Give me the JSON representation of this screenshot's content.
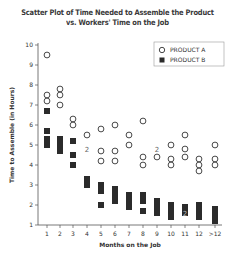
{
  "chart_data": {
    "type": "scatter",
    "title": "Scatter Plot of Time Needed to Assemble the Product",
    "subtitle": "vs. Workers' Time on the Job",
    "xlabel": "Months on the Job",
    "ylabel": "Time to Assemble (in Hours)",
    "categories": [
      "1",
      "2",
      "3",
      "4",
      "5",
      "6",
      "7",
      "8",
      "9",
      "10",
      "11",
      "12",
      ">12"
    ],
    "yticks": [
      1,
      2,
      3,
      4,
      5,
      6,
      7,
      8,
      9,
      10
    ],
    "ylim": [
      1,
      10
    ],
    "grid": false,
    "legend_position": "top-right",
    "series": [
      {
        "name": "PRODUCT A",
        "marker": "open-circle",
        "points": [
          {
            "x": "1",
            "y": 9.5
          },
          {
            "x": "1",
            "y": 7.5
          },
          {
            "x": "1",
            "y": 7.2
          },
          {
            "x": "2",
            "y": 7.8
          },
          {
            "x": "2",
            "y": 7.5
          },
          {
            "x": "2",
            "y": 7.0
          },
          {
            "x": "3",
            "y": 6.3
          },
          {
            "x": "3",
            "y": 6.0
          },
          {
            "x": "4",
            "y": 5.5
          },
          {
            "x": "4",
            "y": 4.8,
            "count": 2
          },
          {
            "x": "5",
            "y": 5.8
          },
          {
            "x": "5",
            "y": 4.7
          },
          {
            "x": "5",
            "y": 4.2
          },
          {
            "x": "6",
            "y": 6.0
          },
          {
            "x": "6",
            "y": 4.7
          },
          {
            "x": "6",
            "y": 4.2
          },
          {
            "x": "7",
            "y": 5.5
          },
          {
            "x": "7",
            "y": 5.0
          },
          {
            "x": "8",
            "y": 6.2
          },
          {
            "x": "8",
            "y": 4.4
          },
          {
            "x": "8",
            "y": 4.0
          },
          {
            "x": "9",
            "y": 4.8,
            "count": 2
          },
          {
            "x": "9",
            "y": 4.4
          },
          {
            "x": "10",
            "y": 5.0
          },
          {
            "x": "10",
            "y": 4.3
          },
          {
            "x": "10",
            "y": 4.0
          },
          {
            "x": "11",
            "y": 5.5
          },
          {
            "x": "11",
            "y": 4.8
          },
          {
            "x": "11",
            "y": 4.4
          },
          {
            "x": "12",
            "y": 4.3
          },
          {
            "x": "12",
            "y": 4.0
          },
          {
            "x": "12",
            "y": 3.7
          },
          {
            "x": ">12",
            "y": 5.0
          },
          {
            "x": ">12",
            "y": 4.3
          },
          {
            "x": ">12",
            "y": 4.0
          }
        ]
      },
      {
        "name": "PRODUCT B",
        "marker": "filled-square",
        "points": [
          {
            "x": "1",
            "y": 6.7
          },
          {
            "x": "1",
            "y": 5.7
          },
          {
            "x": "1",
            "y": 5.3
          },
          {
            "x": "1",
            "y": 5.0
          },
          {
            "x": "2",
            "y": 5.3
          },
          {
            "x": "2",
            "y": 5.0
          },
          {
            "x": "2",
            "y": 4.7
          },
          {
            "x": "3",
            "y": 5.2
          },
          {
            "x": "3",
            "y": 4.5
          },
          {
            "x": "3",
            "y": 4.0
          },
          {
            "x": "4",
            "y": 3.3
          },
          {
            "x": "4",
            "y": 3.0
          },
          {
            "x": "5",
            "y": 3.0
          },
          {
            "x": "5",
            "y": 2.7
          },
          {
            "x": "5",
            "y": 2.0
          },
          {
            "x": "6",
            "y": 2.8
          },
          {
            "x": "6",
            "y": 2.5
          },
          {
            "x": "6",
            "y": 2.2
          },
          {
            "x": "7",
            "y": 2.5
          },
          {
            "x": "7",
            "y": 2.2
          },
          {
            "x": "7",
            "y": 1.9
          },
          {
            "x": "8",
            "y": 2.5
          },
          {
            "x": "8",
            "y": 2.2
          },
          {
            "x": "8",
            "y": 1.7
          },
          {
            "x": "9",
            "y": 2.2
          },
          {
            "x": "9",
            "y": 1.9
          },
          {
            "x": "9",
            "y": 1.6
          },
          {
            "x": "10",
            "y": 2.0
          },
          {
            "x": "10",
            "y": 1.7
          },
          {
            "x": "10",
            "y": 1.4
          },
          {
            "x": "11",
            "y": 1.9
          },
          {
            "x": "11",
            "y": 1.6,
            "count": 2
          },
          {
            "x": "12",
            "y": 2.0
          },
          {
            "x": "12",
            "y": 1.7
          },
          {
            "x": "12",
            "y": 1.4
          },
          {
            "x": ">12",
            "y": 1.8
          },
          {
            "x": ">12",
            "y": 1.5
          },
          {
            "x": ">12",
            "y": 1.2
          }
        ]
      }
    ],
    "annotations": [
      "\"2\" labels indicate two overlapping data points"
    ]
  },
  "legend": {
    "items": [
      {
        "label": "PRODUCT A",
        "marker": "open-circle"
      },
      {
        "label": "PRODUCT B",
        "marker": "filled-square"
      }
    ]
  },
  "colors": {
    "ink": "#333333",
    "marker_fill": "#2b2b2b",
    "axis": "#555555"
  },
  "layout": {
    "x_pixel": [
      47,
      60,
      73,
      87,
      101,
      115,
      129,
      143,
      157,
      171,
      185,
      199,
      215
    ],
    "y_top_px": 45,
    "y_bottom_px": 225,
    "plot_left_px": 38,
    "plot_right_px": 222
  }
}
